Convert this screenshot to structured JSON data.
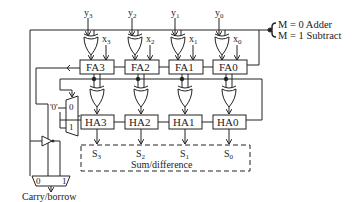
{
  "diagram": {
    "inputs_y": [
      {
        "name": "y",
        "sub": "3"
      },
      {
        "name": "y",
        "sub": "2"
      },
      {
        "name": "y",
        "sub": "1"
      },
      {
        "name": "y",
        "sub": "0"
      }
    ],
    "inputs_x": [
      {
        "name": "x",
        "sub": "3"
      },
      {
        "name": "x",
        "sub": "2"
      },
      {
        "name": "x",
        "sub": "1"
      },
      {
        "name": "x",
        "sub": "0"
      }
    ],
    "full_adders": [
      "FA3",
      "FA2",
      "FA1",
      "FA0"
    ],
    "half_adders": [
      "HA3",
      "HA2",
      "HA1",
      "HA0"
    ],
    "outputs": [
      {
        "name": "S",
        "sub": "3"
      },
      {
        "name": "S",
        "sub": "2"
      },
      {
        "name": "S",
        "sub": "1"
      },
      {
        "name": "S",
        "sub": "0"
      }
    ],
    "output_group_label": "Sum/difference",
    "mode": {
      "line1": "M = 0 Adder",
      "line2": "M = 1 Subtract"
    },
    "mux_top": {
      "const_input": "'0'",
      "in0": "0",
      "in1": "1"
    },
    "mux_bottom": {
      "in0": "0",
      "in1": "1"
    },
    "carry_label": "Carry/borrow"
  }
}
